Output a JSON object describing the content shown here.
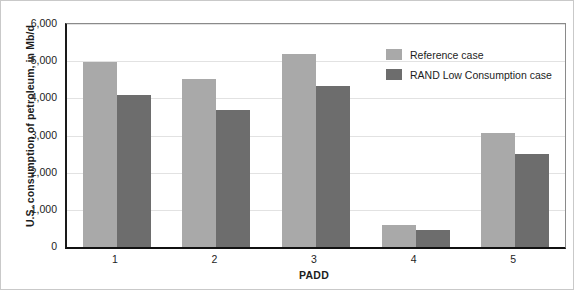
{
  "chart_data": {
    "type": "bar",
    "title": "",
    "xlabel": "PADD",
    "ylabel": "U.S. consumption of petroleum, in Mb/d",
    "categories": [
      "1",
      "2",
      "3",
      "4",
      "5"
    ],
    "series": [
      {
        "name": "Reference case",
        "color": "#a9a9a9",
        "values": [
          4980,
          4520,
          5200,
          600,
          3060
        ]
      },
      {
        "name": "RAND Low Consumption case",
        "color": "#6d6d6d",
        "values": [
          4080,
          3680,
          4320,
          460,
          2500
        ]
      }
    ],
    "ylim": [
      0,
      6000
    ],
    "ytick_labels": [
      "0",
      "1,000",
      "2,000",
      "3,000",
      "4,000",
      "5,000",
      "6,000"
    ],
    "ytick_values": [
      0,
      1000,
      2000,
      3000,
      4000,
      5000,
      6000
    ],
    "grid": true,
    "legend_position": "upper-right-inside"
  }
}
